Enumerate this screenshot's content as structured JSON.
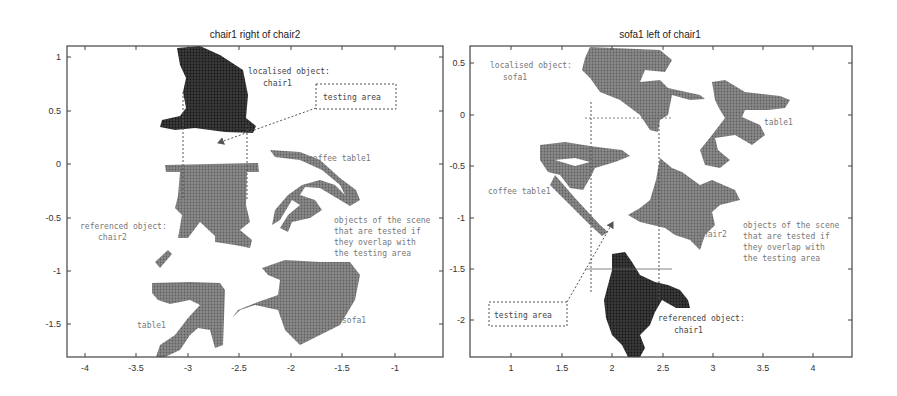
{
  "panels": [
    {
      "title": "chair1 right of chair2",
      "x_ticks": [
        "-4",
        "-3.5",
        "-3",
        "-2.5",
        "-2",
        "-1.5",
        "-1"
      ],
      "y_ticks": [
        "1",
        "0.5",
        "0",
        "-0.5",
        "-1",
        "-1.5"
      ],
      "labels": {
        "localised_line1": "localised object:",
        "localised_line2": "chair1",
        "testing_area": "testing area",
        "coffee_table": "coffee table1",
        "referenced_line1": "referenced object:",
        "referenced_line2": "chair2",
        "objects_line1": "objects of the scene",
        "objects_line2": "that are tested if",
        "objects_line3": "they overlap with",
        "objects_line4": "the testing area",
        "table": "table1",
        "sofa": "sofa1"
      }
    },
    {
      "title": "sofa1 left of chair1",
      "x_ticks": [
        "1",
        "1.5",
        "2",
        "2.5",
        "3",
        "3.5",
        "4"
      ],
      "y_ticks": [
        "0.5",
        "0",
        "-0.5",
        "-1",
        "-1.5",
        "-2"
      ],
      "labels": {
        "localised_line1": "localised object:",
        "localised_line2": "sofa1",
        "table": "table1",
        "coffee_table": "coffee table1",
        "chair": "chair2",
        "objects_line1": "objects of the scene",
        "objects_line2": "that are tested if",
        "objects_line3": "they overlap with",
        "objects_line4": "the testing area",
        "testing_area": "testing area",
        "referenced_line1": "referenced object:",
        "referenced_line2": "chair1"
      }
    }
  ],
  "colors": {
    "localised_object": "#2a2a2a",
    "referenced_object": "#2a2a2a",
    "other_objects": "#7a7a7a",
    "frame": "#444444",
    "annotation_text": "#777777"
  }
}
